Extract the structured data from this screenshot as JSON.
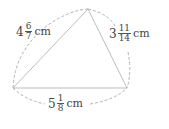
{
  "figure": {
    "shape": "triangle",
    "vertices": {
      "top": [
        88,
        9
      ],
      "left": [
        13,
        88
      ],
      "right": [
        127,
        88
      ]
    },
    "colors": {
      "side": "#bdbdbd",
      "dash": "#9e9e9e",
      "text": "#444444"
    }
  },
  "labels": {
    "left_side": {
      "whole": "4",
      "numerator": "6",
      "denominator": "7",
      "unit": "cm"
    },
    "right_side": {
      "whole": "3",
      "numerator": "11",
      "denominator": "14",
      "unit": "cm"
    },
    "bottom_side": {
      "whole": "5",
      "numerator": "1",
      "denominator": "8",
      "unit": "cm"
    }
  }
}
